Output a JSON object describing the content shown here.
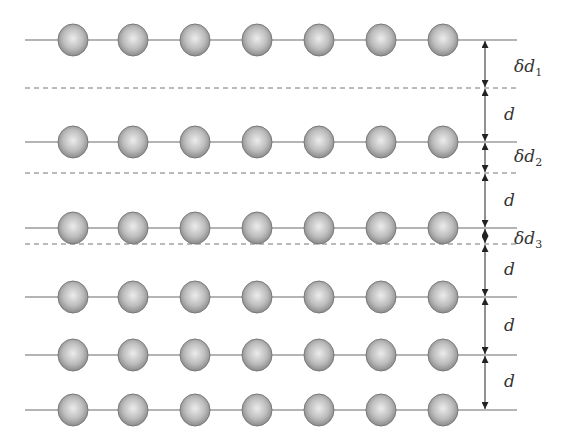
{
  "diagram": {
    "colors": {
      "line": "#6a6a6a",
      "atom_edge": "#7a7a7a",
      "atom_light": "#e8e8e8",
      "atom_dark": "#8a8a8a",
      "arrow": "#222222",
      "dashed": "#777777"
    },
    "atom_x": [
      73,
      133,
      195,
      257,
      319,
      381,
      443
    ],
    "atom_radius": 15,
    "line_x": [
      25,
      517
    ],
    "arrow_x": 485,
    "layers": [
      {
        "y": 40
      },
      {
        "y": 142
      },
      {
        "y": 228
      },
      {
        "y": 297
      },
      {
        "y": 355
      },
      {
        "y": 410
      }
    ],
    "dashed_lines": [
      {
        "y": 88
      },
      {
        "y": 173
      },
      {
        "y": 244
      }
    ],
    "spacings": [
      {
        "from": 40,
        "to": 88,
        "label": "δd",
        "subscript": "1",
        "label_y": 72
      },
      {
        "from": 88,
        "to": 142,
        "label": "d",
        "subscript": "",
        "label_y": 120
      },
      {
        "from": 142,
        "to": 173,
        "label": "δd",
        "subscript": "2",
        "label_y": 162
      },
      {
        "from": 173,
        "to": 228,
        "label": "d",
        "subscript": "",
        "label_y": 206
      },
      {
        "from": 228,
        "to": 244,
        "label": "δd",
        "subscript": "3",
        "label_y": 244
      },
      {
        "from": 244,
        "to": 297,
        "label": "d",
        "subscript": "",
        "label_y": 275
      },
      {
        "from": 297,
        "to": 355,
        "label": "d",
        "subscript": "",
        "label_y": 331
      },
      {
        "from": 355,
        "to": 410,
        "label": "d",
        "subscript": "",
        "label_y": 387
      }
    ]
  }
}
